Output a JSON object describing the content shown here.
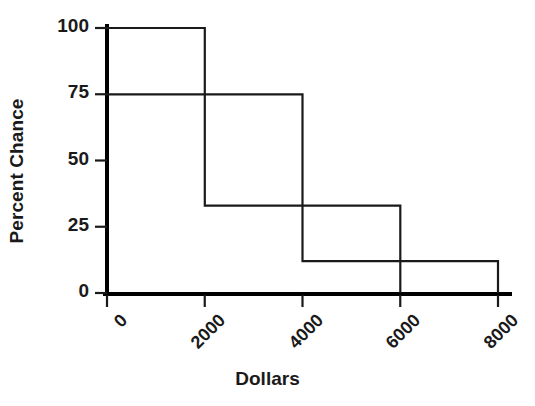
{
  "chart_data": {
    "type": "line",
    "title": "",
    "xlabel": "Dollars",
    "ylabel": "Percent Chance",
    "xlim": [
      0,
      8000
    ],
    "ylim": [
      0,
      100
    ],
    "grid": false,
    "legend": "none",
    "x_ticks": [
      {
        "value": 0,
        "label": "0"
      },
      {
        "value": 2000,
        "label": "2000"
      },
      {
        "value": 4000,
        "label": "4000"
      },
      {
        "value": 6000,
        "label": "6000"
      },
      {
        "value": 8000,
        "label": "8000"
      }
    ],
    "y_ticks": [
      {
        "value": 0,
        "label": "0"
      },
      {
        "value": 25,
        "label": "25"
      },
      {
        "value": 50,
        "label": "50"
      },
      {
        "value": 75,
        "label": "75"
      },
      {
        "value": 100,
        "label": "100"
      }
    ],
    "x_tick_rotation": -45,
    "series": [
      {
        "name": "Step curve A",
        "type": "step",
        "points": [
          {
            "x": 0,
            "y": 100
          },
          {
            "x": 2000,
            "y": 100
          },
          {
            "x": 2000,
            "y": 33
          },
          {
            "x": 6000,
            "y": 33
          },
          {
            "x": 6000,
            "y": 0
          }
        ]
      },
      {
        "name": "Step curve B",
        "type": "step",
        "points": [
          {
            "x": 0,
            "y": 75
          },
          {
            "x": 4000,
            "y": 75
          },
          {
            "x": 4000,
            "y": 12
          },
          {
            "x": 8000,
            "y": 12
          },
          {
            "x": 8000,
            "y": 0
          }
        ]
      }
    ],
    "levels": {
      "curve_a_high": 100,
      "curve_a_low": 33,
      "curve_b_high": 75,
      "curve_b_low": 12
    },
    "colors": {
      "line": "#1a1a1a",
      "axis": "#000000",
      "background": "#ffffff",
      "text": "#1a1a1a"
    }
  },
  "axis": {
    "x_label": "Dollars",
    "y_label": "Percent Chance"
  }
}
